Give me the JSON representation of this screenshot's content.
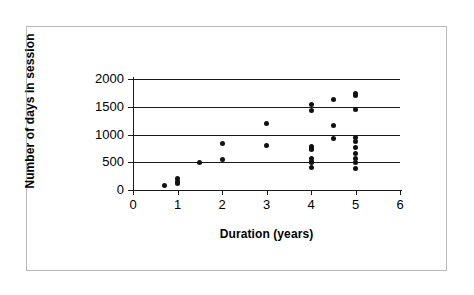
{
  "chart_data": {
    "type": "scatter",
    "title": "",
    "xlabel": "Duration (years)",
    "ylabel": "Number of days in session",
    "xlim": [
      0,
      6
    ],
    "ylim": [
      0,
      2000
    ],
    "xticks": [
      0,
      1,
      2,
      3,
      4,
      5,
      6
    ],
    "yticks": [
      0,
      500,
      1000,
      1500,
      2000
    ],
    "xtick_labels": [
      "0",
      "1",
      "2",
      "3",
      "4",
      "5",
      "6"
    ],
    "ytick_labels": [
      "0",
      "500",
      "1000",
      "1500",
      "2000"
    ],
    "grid": "horizontal",
    "legend": "none",
    "marker": "filled-circle",
    "marker_color": "#111111",
    "series": [
      {
        "name": "sessions",
        "points": [
          {
            "x": 0.7,
            "y": 75
          },
          {
            "x": 1.0,
            "y": 200
          },
          {
            "x": 1.0,
            "y": 150
          },
          {
            "x": 1.0,
            "y": 110
          },
          {
            "x": 1.5,
            "y": 500
          },
          {
            "x": 2.0,
            "y": 830
          },
          {
            "x": 2.0,
            "y": 555
          },
          {
            "x": 3.0,
            "y": 1195
          },
          {
            "x": 3.0,
            "y": 800
          },
          {
            "x": 4.0,
            "y": 1540
          },
          {
            "x": 4.0,
            "y": 1430
          },
          {
            "x": 4.0,
            "y": 790
          },
          {
            "x": 4.0,
            "y": 755
          },
          {
            "x": 4.0,
            "y": 730
          },
          {
            "x": 4.0,
            "y": 560
          },
          {
            "x": 4.0,
            "y": 520
          },
          {
            "x": 4.0,
            "y": 490
          },
          {
            "x": 4.0,
            "y": 400
          },
          {
            "x": 4.5,
            "y": 1630
          },
          {
            "x": 4.5,
            "y": 1160
          },
          {
            "x": 4.5,
            "y": 925
          },
          {
            "x": 5.0,
            "y": 1740
          },
          {
            "x": 5.0,
            "y": 1700
          },
          {
            "x": 5.0,
            "y": 1455
          },
          {
            "x": 5.0,
            "y": 950
          },
          {
            "x": 5.0,
            "y": 880
          },
          {
            "x": 5.0,
            "y": 760
          },
          {
            "x": 5.0,
            "y": 655
          },
          {
            "x": 5.0,
            "y": 560
          },
          {
            "x": 5.0,
            "y": 490
          },
          {
            "x": 5.0,
            "y": 380
          }
        ]
      }
    ]
  }
}
